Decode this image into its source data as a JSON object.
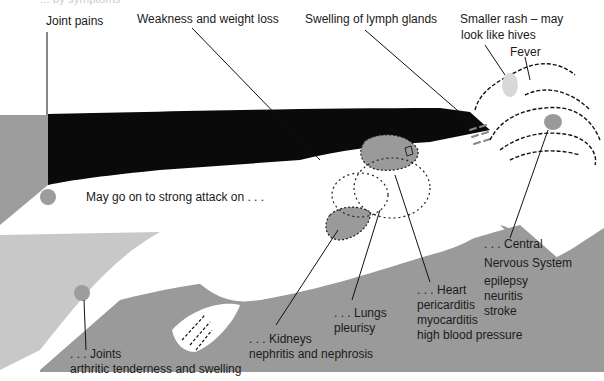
{
  "header_fragment": "... by symptoms",
  "symptom_labels": {
    "joint_pains": "Joint pains",
    "weakness": "Weakness and weight loss",
    "lymph": "Swelling of lymph glands",
    "rash_line1": "Smaller rash – may",
    "rash_line2": "look like hives",
    "fever": "Fever"
  },
  "intro": "May go on to strong attack on . . .",
  "organs": {
    "cns": {
      "title_line1": ". . . Central",
      "title_line2": "Nervous System",
      "conditions": [
        "epilepsy",
        "neuritis",
        "stroke"
      ]
    },
    "heart": {
      "title": ". . . Heart",
      "conditions": [
        "pericarditis",
        "myocarditis",
        "high blood pressure"
      ]
    },
    "lungs": {
      "title": ". . . Lungs",
      "conditions": [
        "pleurisy"
      ]
    },
    "kidneys": {
      "title": ". . . Kidneys",
      "conditions": [
        "nephritis and nephrosis"
      ]
    },
    "joints": {
      "title": ". . . Joints",
      "conditions": [
        "arthritic tenderness and swelling"
      ]
    }
  },
  "colors": {
    "gray": "#999999",
    "light_gray": "#c8c8c8",
    "black": "#0a0a0a",
    "organ": "#9a9a9a"
  }
}
